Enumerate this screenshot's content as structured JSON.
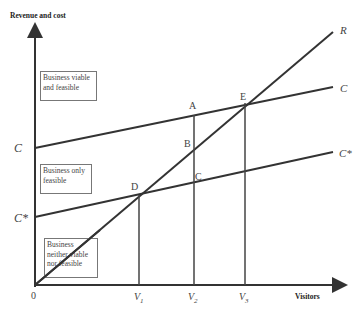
{
  "diagram": {
    "y_axis_label": "Revenue and cost",
    "x_axis_label": "Visitors",
    "origin_label": "0",
    "y_ticks": {
      "c": "C",
      "c_star": "C*"
    },
    "x_ticks": {
      "v1": "V1",
      "v2": "V2",
      "v3": "V3"
    },
    "v_sub": {
      "v": "V",
      "s1": "1",
      "s2": "2",
      "s3": "3"
    },
    "line_labels": {
      "revenue": "R",
      "cost": "C",
      "cost_star": "C*"
    },
    "points": {
      "a": "A",
      "b": "B",
      "c": "C",
      "d": "D",
      "e": "E"
    },
    "regions": {
      "viable": [
        "Business viable",
        "and feasible"
      ],
      "feasible": [
        "Business only",
        "feasible"
      ],
      "neither": [
        "Business",
        "neither viable",
        "nor feasible"
      ]
    },
    "colors": {
      "line": "#333333",
      "text": "#444444",
      "box_border": "#777777"
    }
  }
}
